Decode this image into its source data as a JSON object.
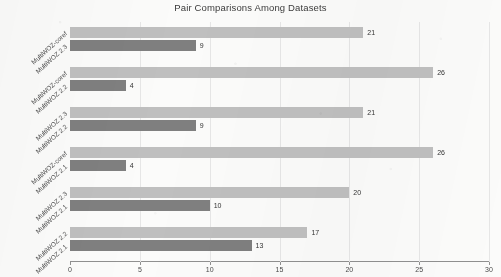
{
  "chart_data": {
    "type": "bar",
    "orientation": "horizontal",
    "title": "Pair Comparisons Among Datasets",
    "xlabel": "",
    "ylabel": "",
    "xlim": [
      0,
      30
    ],
    "xticks": [
      0,
      5,
      10,
      15,
      20,
      25,
      30
    ],
    "xtick_labels": [
      "0",
      "5",
      "10",
      "15",
      "20",
      "25",
      "30"
    ],
    "grid": true,
    "legend": "none",
    "colors": {
      "series_1": "#BFBFBF",
      "series_2": "#7F7F7F",
      "gridline": "#E6E6E6",
      "axis": "#909090",
      "text": "#3B3B3B"
    },
    "categories": [
      {
        "top": "MultiWOZ-coref",
        "bottom": "MultiWOZ 2.3"
      },
      {
        "top": "MultiWOZ-coref",
        "bottom": "MultiWOZ 2.2"
      },
      {
        "top": "MultiWOZ 2.3",
        "bottom": "MultiWOZ 2.2"
      },
      {
        "top": "MultiWOZ-coref",
        "bottom": "MultiWOZ 2.1"
      },
      {
        "top": "MultiWOZ 2.3",
        "bottom": "MultiWOZ 2.1"
      },
      {
        "top": "MultiWOZ 2.2",
        "bottom": "MultiWOZ 2.1"
      }
    ],
    "series": [
      {
        "name": "series_1",
        "values": [
          21,
          26,
          21,
          26,
          20,
          17
        ]
      },
      {
        "name": "series_2",
        "values": [
          9,
          4,
          9,
          4,
          10,
          13
        ]
      }
    ],
    "data_labels": [
      {
        "group": 0,
        "series_1": "21",
        "series_2": "9"
      },
      {
        "group": 1,
        "series_1": "26",
        "series_2": "4"
      },
      {
        "group": 2,
        "series_1": "21",
        "series_2": "9"
      },
      {
        "group": 3,
        "series_1": "26",
        "series_2": "4"
      },
      {
        "group": 4,
        "series_1": "20",
        "series_2": "10"
      },
      {
        "group": 5,
        "series_1": "17",
        "series_2": "13"
      }
    ]
  }
}
